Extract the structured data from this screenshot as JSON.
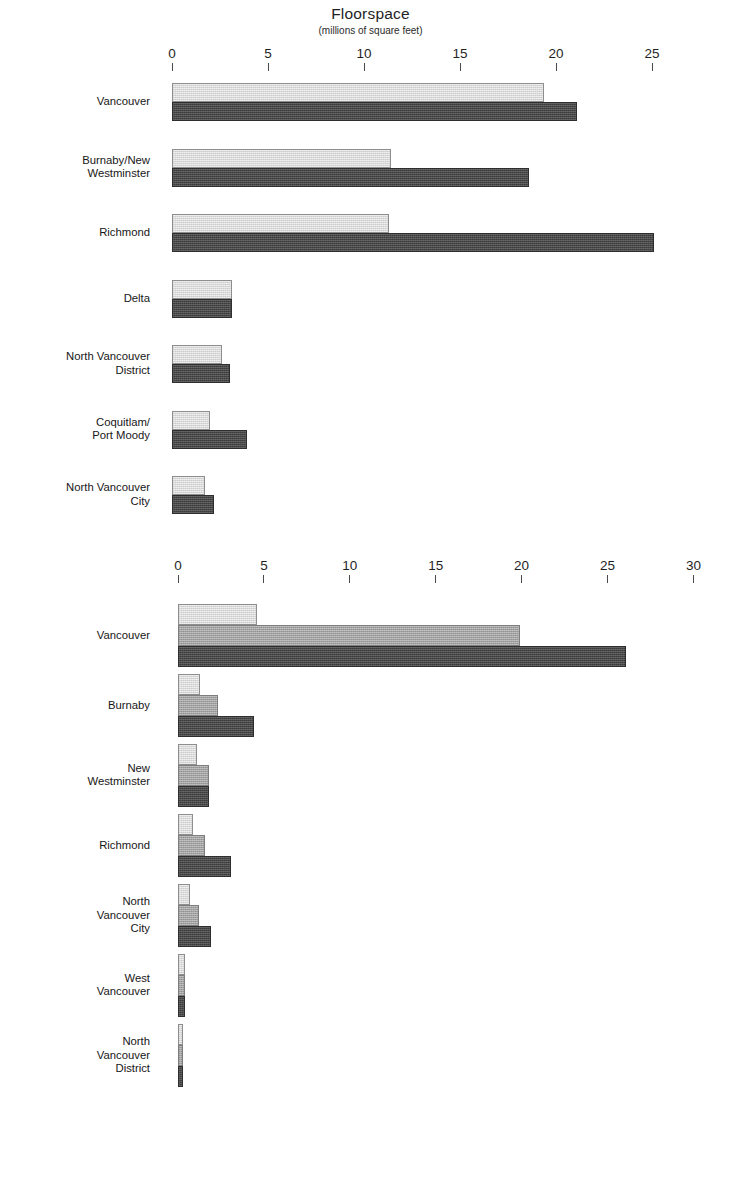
{
  "title": {
    "main": "Floorspace",
    "subtitle": "(millions of square feet)"
  },
  "colors": {
    "light": "#d9d9d9",
    "mid": "#a3a3a3",
    "dark": "#3b3b3b",
    "gridline": "#ffffff",
    "text": "#1a1a1a"
  },
  "chart_data": [
    {
      "type": "bar",
      "orientation": "horizontal",
      "title": "Floorspace",
      "subtitle": "(millions of square feet)",
      "xlabel": "",
      "ylabel": "",
      "xlim": [
        0,
        25
      ],
      "ticks": [
        0,
        5,
        10,
        15,
        20,
        25
      ],
      "tick_labels": [
        "0",
        "5",
        "10",
        "15",
        "20",
        "25"
      ],
      "grid": true,
      "legend": "none",
      "categories": [
        "Vancouver",
        "Burnaby/New Westminster",
        "Richmond",
        "Delta",
        "North Vancouver District",
        "Coquitlam/Port Moody",
        "North Vancouver City"
      ],
      "series": [
        {
          "name": "series-1-light",
          "shade": "light",
          "values": [
            19.4,
            11.4,
            11.3,
            3.1,
            2.6,
            2.0,
            1.7
          ]
        },
        {
          "name": "series-2-dark",
          "shade": "dark",
          "values": [
            21.1,
            18.6,
            25.1,
            3.1,
            3.0,
            3.9,
            2.2
          ]
        }
      ]
    },
    {
      "type": "bar",
      "orientation": "horizontal",
      "title": "",
      "subtitle": "",
      "xlabel": "",
      "ylabel": "",
      "xlim": [
        0,
        30
      ],
      "ticks": [
        0,
        5,
        10,
        15,
        20,
        25,
        30
      ],
      "tick_labels": [
        "0",
        "5",
        "10",
        "15",
        "20",
        "25",
        "30"
      ],
      "grid": true,
      "legend": "none",
      "categories": [
        "Vancouver",
        "Burnaby",
        "New Westminster",
        "Richmond",
        "North Vancouver City",
        "West Vancouver",
        "North Vancouver District"
      ],
      "series": [
        {
          "name": "series-1-light",
          "shade": "light",
          "values": [
            4.6,
            1.3,
            1.1,
            0.9,
            0.7,
            0.4,
            0.3
          ]
        },
        {
          "name": "series-2-mid",
          "shade": "mid",
          "values": [
            19.9,
            2.3,
            1.8,
            1.6,
            1.2,
            0.4,
            0.3
          ]
        },
        {
          "name": "series-3-dark",
          "shade": "dark",
          "values": [
            26.1,
            4.4,
            1.8,
            3.1,
            1.9,
            0.4,
            0.3
          ]
        }
      ]
    }
  ],
  "chart_one": {
    "axis": {
      "labels": [
        "0",
        "5",
        "10",
        "15",
        "20",
        "25"
      ]
    },
    "rows": [
      {
        "label_lines": [
          "Vancouver"
        ]
      },
      {
        "label_lines": [
          "Burnaby/New",
          "Westminster"
        ]
      },
      {
        "label_lines": [
          "Richmond"
        ]
      },
      {
        "label_lines": [
          "Delta"
        ]
      },
      {
        "label_lines": [
          "North Vancouver",
          "District"
        ]
      },
      {
        "label_lines": [
          "Coquitlam/",
          "Port Moody"
        ]
      },
      {
        "label_lines": [
          "North Vancouver",
          "City"
        ]
      }
    ]
  },
  "chart_two": {
    "axis": {
      "labels": [
        "0",
        "5",
        "10",
        "15",
        "20",
        "25",
        "30"
      ]
    },
    "rows": [
      {
        "label_lines": [
          "Vancouver"
        ]
      },
      {
        "label_lines": [
          "Burnaby"
        ]
      },
      {
        "label_lines": [
          "New",
          "Westminster"
        ]
      },
      {
        "label_lines": [
          "Richmond"
        ]
      },
      {
        "label_lines": [
          "North",
          "Vancouver",
          "City"
        ]
      },
      {
        "label_lines": [
          "West",
          "Vancouver"
        ]
      },
      {
        "label_lines": [
          "North",
          "Vancouver",
          "District"
        ]
      }
    ]
  }
}
